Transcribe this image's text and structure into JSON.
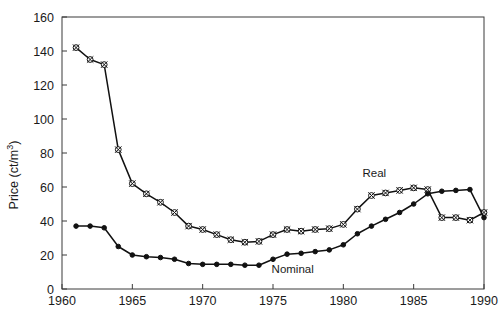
{
  "chart_data": {
    "type": "line",
    "title": "",
    "subtitle": "",
    "xlabel": "",
    "ylabel": "Price (ct/m3)",
    "ylabel_display": "Price (ct/m³)",
    "ylabel_base": "Price (ct/m",
    "ylabel_sup": "3",
    "ylabel_close": ")",
    "xlim": [
      1960,
      1990
    ],
    "ylim": [
      0,
      160
    ],
    "xticks": [
      1960,
      1965,
      1970,
      1975,
      1980,
      1985,
      1990
    ],
    "xtick_labels": [
      "1960",
      "1965",
      "1970",
      "1975",
      "1980",
      "1985",
      "1990"
    ],
    "yticks": [
      0,
      20,
      40,
      60,
      80,
      100,
      120,
      140,
      160
    ],
    "ytick_labels": [
      "0",
      "20",
      "40",
      "60",
      "80",
      "100",
      "120",
      "140",
      "160"
    ],
    "grid": false,
    "legend": "inline-annotations",
    "annotations": [
      {
        "text": "Real",
        "x": 1982.2,
        "y": 66.0
      },
      {
        "text": "Nominal",
        "x": 1976.4,
        "y": 9.5
      }
    ],
    "x": [
      1961,
      1962,
      1963,
      1964,
      1965,
      1966,
      1967,
      1968,
      1969,
      1970,
      1971,
      1972,
      1973,
      1974,
      1975,
      1976,
      1977,
      1978,
      1979,
      1980,
      1981,
      1982,
      1983,
      1984,
      1985,
      1986,
      1987,
      1988,
      1989,
      1990
    ],
    "series": [
      {
        "name": "Real",
        "marker": "circle-cross-open",
        "values": [
          142,
          135,
          132,
          82,
          62,
          56,
          51,
          45,
          37,
          35,
          32,
          29,
          27.5,
          28,
          32,
          35,
          34,
          35,
          35.5,
          38,
          47,
          55,
          56.5,
          58,
          59.5,
          58.5,
          42,
          42,
          40.5,
          45
        ]
      },
      {
        "name": "Nominal",
        "marker": "circle-filled",
        "values": [
          37,
          37,
          36,
          25,
          20,
          19,
          18.5,
          17.5,
          15,
          14.5,
          14.5,
          14.5,
          14,
          14,
          17.5,
          20.5,
          21,
          22,
          23,
          26,
          32.5,
          37,
          41,
          45,
          50,
          56,
          57.5,
          58,
          58.5,
          42
        ]
      }
    ]
  },
  "axes": {
    "plot_left_px": 62,
    "plot_right_px": 484,
    "plot_top_px": 17,
    "plot_bottom_px": 289
  }
}
